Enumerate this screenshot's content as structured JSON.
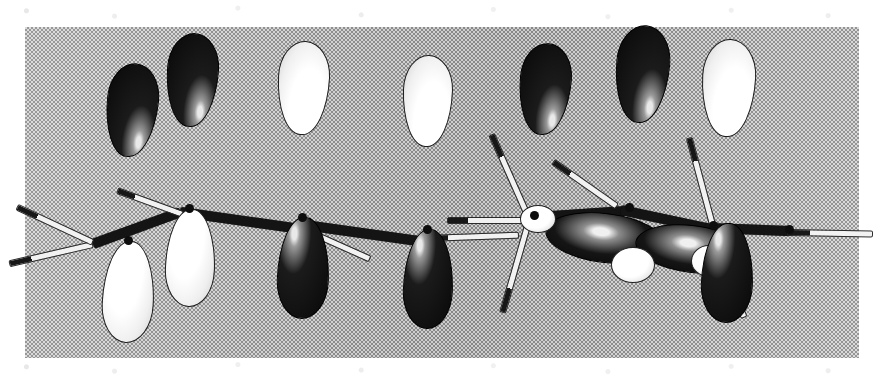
{
  "figure": {
    "domain_kind": "scanned-textbook-illustration",
    "caption": "",
    "labels": [],
    "background": {
      "page_color": "#ffffff",
      "plate_color": "#b9b9b9",
      "plate_dither_dark": "#8e8e8e",
      "plate_dither_light": "#d8d8d8",
      "plate_rect": {
        "x": 25,
        "y": 27,
        "width": 834,
        "height": 331
      }
    },
    "palette": {
      "lobe_positive_phase": "#0a0a0a",
      "lobe_negative_phase": "#f5f5f5",
      "bond_carbon": "#141414",
      "bond_hydrogen": "#f2f2f2",
      "highlight": "#ffffff"
    },
    "models": [
      {
        "name": "left-model",
        "view": "side-on",
        "description": "butadiene chain viewed side-on, four p orbitals with alternating phases",
        "atom_count": 4,
        "lobe_pairs": 4,
        "phase_pattern_top": [
          "dark",
          "dark",
          "light",
          "light"
        ],
        "phase_pattern_bottom": [
          "light",
          "light",
          "dark",
          "dark"
        ]
      },
      {
        "name": "right-model",
        "view": "rotated-end-on",
        "description": "same chain rotated so two central p orbitals are foreshortened toward viewer",
        "atom_count": 4,
        "lobe_pairs": 4,
        "phase_pattern_top": [
          "light",
          "dark",
          "dark",
          "light"
        ],
        "phase_pattern_bottom": [
          "dark",
          "light",
          "light",
          "dark"
        ]
      }
    ]
  }
}
